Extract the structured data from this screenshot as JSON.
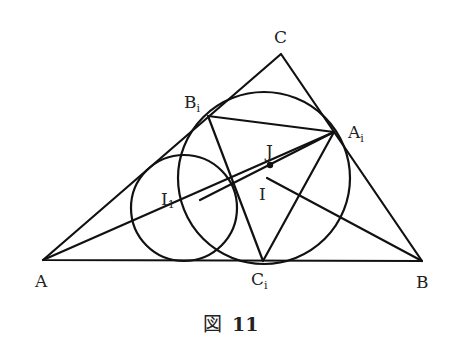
{
  "figure": {
    "caption_prefix": "図",
    "caption_number": "11"
  },
  "points": {
    "A": {
      "label": "A",
      "sub": ""
    },
    "B": {
      "label": "B",
      "sub": ""
    },
    "C": {
      "label": "C",
      "sub": ""
    },
    "Ai": {
      "label": "A",
      "sub": "i"
    },
    "Bi": {
      "label": "B",
      "sub": "i"
    },
    "Ci": {
      "label": "C",
      "sub": "i"
    },
    "I": {
      "label": "I",
      "sub": ""
    },
    "I1": {
      "label": "I",
      "sub": "1"
    },
    "J": {
      "label": "J",
      "sub": ""
    }
  },
  "colors": {
    "stroke": "#111111",
    "background": "#ffffff"
  }
}
